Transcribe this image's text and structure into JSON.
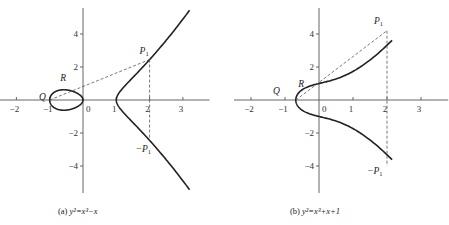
{
  "chart_data": [
    {
      "type": "line",
      "id": "a",
      "equation": "y^2 = x^3 - x",
      "caption": {
        "prefix": "(a) ",
        "text": "y²=x³−x"
      },
      "xlim": [
        -2.5,
        3.8
      ],
      "ylim": [
        -5.5,
        5.5
      ],
      "x_ticks": [
        -2,
        -1,
        0,
        1,
        2,
        3
      ],
      "x_tick_labels": [
        "−2",
        "−1",
        "0",
        "1",
        "2",
        "3"
      ],
      "y_ticks": [
        4,
        2,
        -2,
        -4
      ],
      "y_tick_labels": [
        "4",
        "2",
        "−2",
        "−4"
      ],
      "curve_x_max": 3.2,
      "points": {
        "Q": {
          "label": "Q",
          "x": -0.9,
          "y": 0.15
        },
        "R": {
          "label": "R",
          "x": -0.5,
          "y": 0.85
        },
        "P1": {
          "label": "P",
          "sub": "1",
          "x": 2.0,
          "y": 2.45
        },
        "negP1": {
          "label": "−P",
          "sub": "1",
          "x": 2.0,
          "y": -2.45
        }
      },
      "secant": {
        "from": [
          -1.0,
          0.0
        ],
        "to": [
          2.0,
          2.45
        ]
      },
      "vertical_dash": {
        "x": 2.0,
        "y1": 2.45,
        "y2": -2.45
      }
    },
    {
      "type": "line",
      "id": "b",
      "equation": "y^2 = x^3 + x + 1",
      "caption": {
        "prefix": "(b) ",
        "text": "y²=x³+x+1"
      },
      "xlim": [
        -2.5,
        3.8
      ],
      "ylim": [
        -5.5,
        5.5
      ],
      "x_ticks": [
        -2,
        -1,
        0,
        1,
        2,
        3
      ],
      "x_tick_labels": [
        "−2",
        "−1",
        "0",
        "1",
        "2",
        "3"
      ],
      "y_ticks": [
        4,
        2,
        -2,
        -4
      ],
      "y_tick_labels": [
        "4",
        "2",
        "−2",
        "−4"
      ],
      "curve_x_max": 2.15,
      "points": {
        "Q": {
          "label": "Q",
          "x": -1.0,
          "y": 0.2
        },
        "R": {
          "label": "R",
          "x": -0.55,
          "y": 0.65
        },
        "P1": {
          "label": "P",
          "sub": "1",
          "x": 2.0,
          "y": 4.0
        },
        "negP1": {
          "label": "−P",
          "sub": "1",
          "x": 2.0,
          "y": -4.0
        }
      },
      "secant": {
        "from": [
          -0.68,
          0.0
        ],
        "to": [
          2.0,
          4.2
        ]
      },
      "vertical_dash": {
        "x": 2.0,
        "y1": 4.2,
        "y2": -4.0
      }
    }
  ]
}
